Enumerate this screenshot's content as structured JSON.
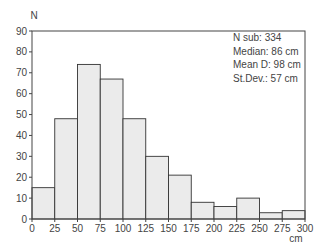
{
  "chart_data": {
    "type": "bar",
    "title": "",
    "xlabel": "cm",
    "ylabel": "N",
    "ylim": [
      0,
      90
    ],
    "xlim": [
      0,
      300
    ],
    "grid": false,
    "bin_edges": [
      0,
      25,
      50,
      75,
      100,
      125,
      150,
      175,
      200,
      225,
      250,
      275,
      300
    ],
    "categories": [
      "0-25",
      "25-50",
      "50-75",
      "75-100",
      "100-125",
      "125-150",
      "150-175",
      "175-200",
      "200-225",
      "225-250",
      "250-275",
      "275-300"
    ],
    "values": [
      15,
      48,
      74,
      67,
      48,
      30,
      21,
      8,
      6,
      10,
      3,
      4
    ],
    "x_ticks": [
      "0",
      "25",
      "50",
      "75",
      "100",
      "125",
      "150",
      "175",
      "200",
      "225",
      "250",
      "275",
      "300"
    ],
    "y_ticks": [
      "0",
      "10",
      "20",
      "30",
      "40",
      "50",
      "60",
      "70",
      "80",
      "90"
    ],
    "annotations": [
      "N sub: 334",
      "Median: 86 cm",
      "Mean D: 98 cm",
      "St.Dev.: 57 cm"
    ],
    "colors": {
      "bar_fill": "#ebebeb",
      "bar_edge": "#333333",
      "axis": "#444444"
    }
  },
  "stats": {
    "n_sub": "N sub: 334",
    "median": "Median: 86 cm",
    "mean": "Mean D: 98 cm",
    "stdev": "St.Dev.: 57 cm"
  },
  "axis": {
    "y_label": "N",
    "x_unit": "cm"
  }
}
